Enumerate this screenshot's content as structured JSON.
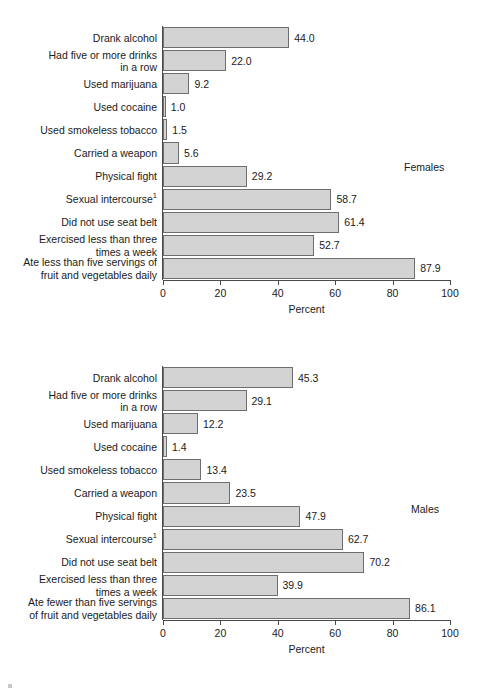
{
  "figure": {
    "panels": [
      {
        "id": "females",
        "series_tag": "Females",
        "xlabel": "Percent",
        "tick_labels": [
          "0",
          "20",
          "40",
          "60",
          "80",
          "100"
        ],
        "categories": [
          "Drank alcohol",
          "Had five or more drinks\nin a row",
          "Used marijuana",
          "Used cocaine",
          "Used smokeless tobacco",
          "Carried a weapon",
          "Physical fight",
          "Sexual intercourse",
          "Did not use seat belt",
          "Exercised less than three\ntimes a week",
          "Ate less than five servings of\nfruit and vegetables daily"
        ],
        "footnote_markers": [
          "",
          "",
          "",
          "",
          "",
          "",
          "",
          "1",
          "",
          "",
          ""
        ],
        "values": [
          44.0,
          22.0,
          9.2,
          1.0,
          1.5,
          5.6,
          29.2,
          58.7,
          61.4,
          52.7,
          87.9
        ],
        "value_labels": [
          "44.0",
          "22.0",
          "9.2",
          "1.0",
          "1.5",
          "5.6",
          "29.2",
          "58.7",
          "61.4",
          "52.7",
          "87.9"
        ]
      },
      {
        "id": "males",
        "series_tag": "Males",
        "xlabel": "Percent",
        "tick_labels": [
          "0",
          "20",
          "40",
          "60",
          "80",
          "100"
        ],
        "categories": [
          "Drank alcohol",
          "Had five or more drinks\nin a row",
          "Used marijuana",
          "Used cocaine",
          "Used smokeless tobacco",
          "Carried a weapon",
          "Physical fight",
          "Sexual intercourse",
          "Did not use seat belt",
          "Exercised less than three\ntimes a week",
          "Ate fewer than five servings\nof fruit and vegetables daily"
        ],
        "footnote_markers": [
          "",
          "",
          "",
          "",
          "",
          "",
          "",
          "1",
          "",
          "",
          ""
        ],
        "values": [
          45.3,
          29.1,
          12.2,
          1.4,
          13.4,
          23.5,
          47.9,
          62.7,
          70.2,
          39.9,
          86.1
        ],
        "value_labels": [
          "45.3",
          "29.1",
          "12.2",
          "1.4",
          "13.4",
          "23.5",
          "47.9",
          "62.7",
          "70.2",
          "39.9",
          "86.1"
        ]
      }
    ]
  },
  "chart_data": [
    {
      "type": "bar",
      "orientation": "horizontal",
      "title": "Females",
      "xlabel": "Percent",
      "ylabel": "",
      "xlim": [
        0,
        100
      ],
      "xticks": [
        0,
        20,
        40,
        60,
        80,
        100
      ],
      "grid": false,
      "legend": "none",
      "series_label_position": "upper-right",
      "categories": [
        "Drank alcohol",
        "Had five or more drinks in a row",
        "Used marijuana",
        "Used cocaine",
        "Used smokeless tobacco",
        "Carried a weapon",
        "Physical fight",
        "Sexual intercourse¹",
        "Did not use seat belt",
        "Exercised less than three times a week",
        "Ate less than five servings of fruit and vegetables daily"
      ],
      "values": [
        44.0,
        22.0,
        9.2,
        1.0,
        1.5,
        5.6,
        29.2,
        58.7,
        61.4,
        52.7,
        87.9
      ],
      "bar_color": "#d3d3d3",
      "bar_edge_color": "#6e6e6e"
    },
    {
      "type": "bar",
      "orientation": "horizontal",
      "title": "Males",
      "xlabel": "Percent",
      "ylabel": "",
      "xlim": [
        0,
        100
      ],
      "xticks": [
        0,
        20,
        40,
        60,
        80,
        100
      ],
      "grid": false,
      "legend": "none",
      "series_label_position": "upper-right",
      "categories": [
        "Drank alcohol",
        "Had five or more drinks in a row",
        "Used marijuana",
        "Used cocaine",
        "Used smokeless tobacco",
        "Carried a weapon",
        "Physical fight",
        "Sexual intercourse¹",
        "Did not use seat belt",
        "Exercised less than three times a week",
        "Ate fewer than five servings of fruit and vegetables daily"
      ],
      "values": [
        45.3,
        29.1,
        12.2,
        1.4,
        13.4,
        23.5,
        47.9,
        62.7,
        70.2,
        39.9,
        86.1
      ],
      "bar_color": "#d3d3d3",
      "bar_edge_color": "#6e6e6e"
    }
  ]
}
